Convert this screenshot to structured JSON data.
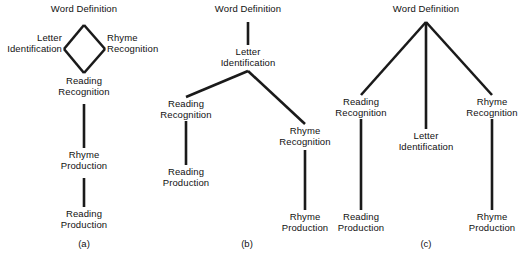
{
  "figure": {
    "width": 523,
    "height": 259,
    "background_color": "#ffffff",
    "line_color": "#1a1a1a",
    "text_color": "#111111",
    "type": "three-panel hierarchy / ordering-theory diagram"
  },
  "panels": [
    {
      "id": "a",
      "caption": "(a)",
      "caption_x": 84,
      "caption_y": 238,
      "nodes": [
        {
          "id": "a-word-definition",
          "label": "Word Definition",
          "x": 84,
          "y": 4,
          "align": "center"
        },
        {
          "id": "a-letter-id",
          "label": "Letter\nIdentification",
          "x": 62,
          "y": 33,
          "align": "right"
        },
        {
          "id": "a-rhyme-recognition",
          "label": "Rhyme\nRecognition",
          "x": 107,
          "y": 33,
          "align": "left"
        },
        {
          "id": "a-reading-recognition",
          "label": "Reading\nRecognition",
          "x": 84,
          "y": 76,
          "align": "center"
        },
        {
          "id": "a-rhyme-production",
          "label": "Rhyme\nProduction",
          "x": 84,
          "y": 150,
          "align": "center"
        },
        {
          "id": "a-reading-production",
          "label": "Reading\nProduction",
          "x": 84,
          "y": 209,
          "align": "center"
        }
      ],
      "edges": [
        {
          "from": "a-word-definition",
          "to": "a-letter-id",
          "x1": 84,
          "y1": 25,
          "x2": 64,
          "y2": 49
        },
        {
          "from": "a-word-definition",
          "to": "a-rhyme-recognition",
          "x1": 84,
          "y1": 25,
          "x2": 105,
          "y2": 49
        },
        {
          "from": "a-letter-id",
          "to": "a-reading-recognition",
          "x1": 64,
          "y1": 49,
          "x2": 84,
          "y2": 73
        },
        {
          "from": "a-rhyme-recognition",
          "to": "a-reading-recognition",
          "x1": 105,
          "y1": 49,
          "x2": 84,
          "y2": 73
        },
        {
          "from": "a-reading-recognition",
          "to": "a-rhyme-production",
          "x1": 84,
          "y1": 104,
          "x2": 84,
          "y2": 148
        },
        {
          "from": "a-rhyme-production",
          "to": "a-reading-production",
          "x1": 84,
          "y1": 178,
          "x2": 84,
          "y2": 207
        }
      ]
    },
    {
      "id": "b",
      "caption": "(b)",
      "caption_x": 247,
      "caption_y": 238,
      "nodes": [
        {
          "id": "b-word-definition",
          "label": "Word Definition",
          "x": 248,
          "y": 4,
          "align": "center"
        },
        {
          "id": "b-letter-id",
          "label": "Letter\nIdentification",
          "x": 248,
          "y": 47,
          "align": "center"
        },
        {
          "id": "b-reading-recognition",
          "label": "Reading\nRecognition",
          "x": 186,
          "y": 99,
          "align": "center"
        },
        {
          "id": "b-reading-production",
          "label": "Reading\nProduction",
          "x": 186,
          "y": 167,
          "align": "center"
        },
        {
          "id": "b-rhyme-recognition",
          "label": "Rhyme\nRecognition",
          "x": 305,
          "y": 126,
          "align": "center"
        },
        {
          "id": "b-rhyme-production",
          "label": "Rhyme\nProduction",
          "x": 305,
          "y": 212,
          "align": "center"
        }
      ],
      "edges": [
        {
          "from": "b-word-definition",
          "to": "b-letter-id",
          "x1": 248,
          "y1": 22,
          "x2": 248,
          "y2": 45
        },
        {
          "from": "b-letter-id",
          "to": "b-reading-recognition",
          "x1": 248,
          "y1": 71,
          "x2": 186,
          "y2": 97
        },
        {
          "from": "b-letter-id",
          "to": "b-rhyme-recognition",
          "x1": 248,
          "y1": 71,
          "x2": 305,
          "y2": 124
        },
        {
          "from": "b-reading-recognition",
          "to": "b-reading-production",
          "x1": 186,
          "y1": 121,
          "x2": 186,
          "y2": 165
        },
        {
          "from": "b-rhyme-recognition",
          "to": "b-rhyme-production",
          "x1": 305,
          "y1": 150,
          "x2": 305,
          "y2": 210
        }
      ]
    },
    {
      "id": "c",
      "caption": "(c)",
      "caption_x": 426,
      "caption_y": 238,
      "nodes": [
        {
          "id": "c-word-definition",
          "label": "Word Definition",
          "x": 426,
          "y": 4,
          "align": "center"
        },
        {
          "id": "c-reading-recognition",
          "label": "Reading\nRecognition",
          "x": 361,
          "y": 97,
          "align": "center"
        },
        {
          "id": "c-letter-id",
          "label": "Letter\nIdentification",
          "x": 426,
          "y": 131,
          "align": "center"
        },
        {
          "id": "c-rhyme-recognition",
          "label": "Rhyme\nRecognition",
          "x": 492,
          "y": 97,
          "align": "center"
        },
        {
          "id": "c-reading-production",
          "label": "Reading\nProduction",
          "x": 361,
          "y": 212,
          "align": "center"
        },
        {
          "id": "c-rhyme-production",
          "label": "Rhyme\nProduction",
          "x": 492,
          "y": 212,
          "align": "center"
        }
      ],
      "edges": [
        {
          "from": "c-word-definition",
          "to": "c-reading-recognition",
          "x1": 426,
          "y1": 22,
          "x2": 361,
          "y2": 95
        },
        {
          "from": "c-word-definition",
          "to": "c-letter-id",
          "x1": 426,
          "y1": 22,
          "x2": 426,
          "y2": 129
        },
        {
          "from": "c-word-definition",
          "to": "c-rhyme-recognition",
          "x1": 426,
          "y1": 22,
          "x2": 492,
          "y2": 95
        },
        {
          "from": "c-reading-recognition",
          "to": "c-reading-production",
          "x1": 361,
          "y1": 119,
          "x2": 361,
          "y2": 210
        },
        {
          "from": "c-rhyme-recognition",
          "to": "c-rhyme-production",
          "x1": 492,
          "y1": 119,
          "x2": 492,
          "y2": 210
        }
      ]
    }
  ]
}
